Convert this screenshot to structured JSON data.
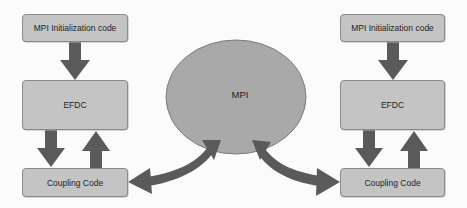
{
  "diagram": {
    "left": {
      "init_label": "MPI Initialization code",
      "model_label": "EFDC",
      "coupling_label": "Coupling Code"
    },
    "center": {
      "label": "MPI"
    },
    "right": {
      "init_label": "MPI Initialization code",
      "model_label": "EFDC",
      "coupling_label": "Coupling Code"
    },
    "colors": {
      "box_fill": "#c4c4c4",
      "box_border": "#8a8a8a",
      "ellipse_fill": "#a9a9a9",
      "arrow_fill": "#5a5a5a",
      "background": "#fbfbfb"
    }
  }
}
